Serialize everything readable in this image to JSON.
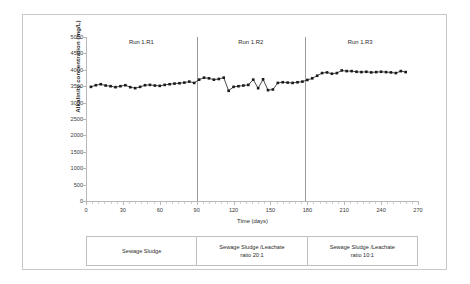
{
  "chart_data": {
    "type": "line",
    "title": "",
    "xlabel": "Time (days)",
    "ylabel": "Alkalinity concentration (mg/L)",
    "xlim": [
      0,
      270
    ],
    "ylim": [
      0,
      5000
    ],
    "xticks": [
      0,
      30,
      60,
      90,
      120,
      150,
      180,
      210,
      240,
      270
    ],
    "yticks": [
      0,
      500,
      1000,
      1500,
      2000,
      2500,
      3000,
      3500,
      4000,
      4500,
      5000
    ],
    "grid": false,
    "legend": "none",
    "marker": "square",
    "marker_color": "#1a1a1a",
    "line_color": "#1a1a1a",
    "annotations": [
      {
        "text": "Run 1.R1",
        "x": 45
      },
      {
        "text": "Run 1.R2",
        "x": 134
      },
      {
        "text": "Run 1.R3",
        "x": 223
      }
    ],
    "dividers": [
      90,
      178
    ],
    "x": [
      4,
      8,
      12,
      16,
      20,
      24,
      28,
      32,
      36,
      40,
      44,
      48,
      52,
      56,
      60,
      64,
      68,
      72,
      76,
      80,
      84,
      88,
      92,
      96,
      100,
      104,
      108,
      112,
      116,
      120,
      124,
      128,
      132,
      136,
      140,
      144,
      148,
      152,
      156,
      160,
      164,
      168,
      172,
      176,
      180,
      184,
      188,
      192,
      196,
      200,
      204,
      208,
      212,
      216,
      220,
      224,
      228,
      232,
      236,
      240,
      244,
      248,
      252,
      256,
      260
    ],
    "values": [
      3480,
      3530,
      3560,
      3520,
      3500,
      3470,
      3500,
      3530,
      3470,
      3440,
      3480,
      3530,
      3540,
      3520,
      3510,
      3540,
      3560,
      3580,
      3590,
      3610,
      3640,
      3600,
      3700,
      3760,
      3740,
      3700,
      3720,
      3760,
      3360,
      3480,
      3500,
      3520,
      3540,
      3700,
      3440,
      3710,
      3380,
      3400,
      3600,
      3620,
      3610,
      3600,
      3620,
      3640,
      3690,
      3740,
      3820,
      3900,
      3920,
      3880,
      3900,
      3980,
      3960,
      3960,
      3940,
      3930,
      3940,
      3920,
      3930,
      3940,
      3930,
      3920,
      3900,
      3960,
      3930
    ]
  },
  "condition_table": {
    "cells": [
      {
        "line1": "Sewage Sludge",
        "line2": ""
      },
      {
        "line1": "Sewage Sludge /Leachate",
        "line2": "ratio 20:1"
      },
      {
        "line1": "Sewage Sludge /Leachate",
        "line2": "ratio 10:1"
      }
    ]
  }
}
